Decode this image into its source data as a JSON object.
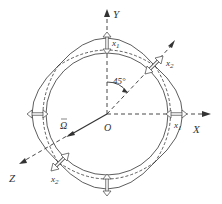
{
  "figure": {
    "type": "ring vibration mode diagram",
    "axes": {
      "x_label": "X",
      "y_label": "Y",
      "z_label": "Z",
      "origin_label": "O"
    },
    "angle_label": "45°",
    "rotation_label": "Ω",
    "displacements": {
      "x1_label": "x",
      "x1_sub": "1",
      "x2_label": "x",
      "x2_sub": "2"
    },
    "colors": {
      "line": "#333333",
      "arrow_fill": "#ffffff",
      "arrow_stroke": "#555555"
    }
  }
}
